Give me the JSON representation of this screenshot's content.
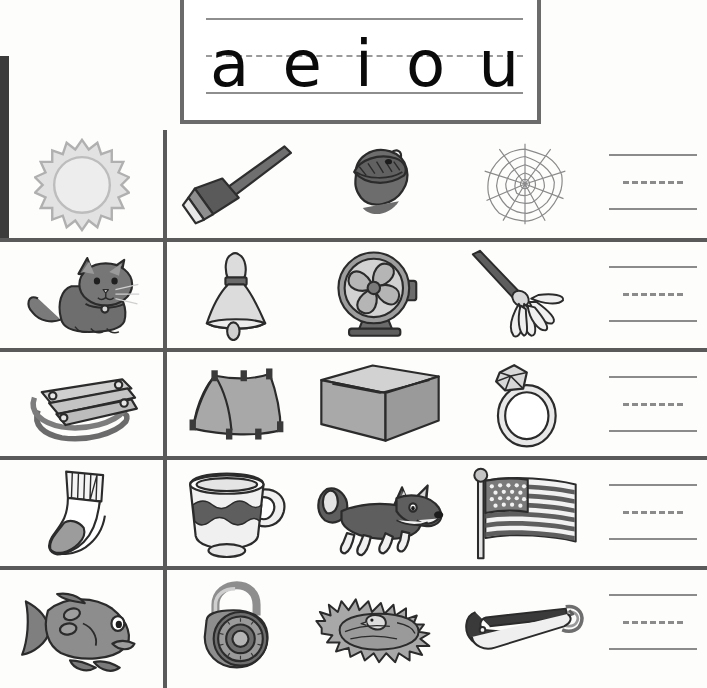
{
  "worksheet": {
    "title": "Short Vowel Beginning Sounds Worksheet",
    "header": {
      "name": "vowel-guide-box",
      "vowels": [
        "a",
        "e",
        "i",
        "o",
        "u"
      ],
      "guide_lines": {
        "top": "solid",
        "middle": "dashed",
        "baseline": "solid"
      }
    },
    "colors": {
      "page_background": "#fdfdfc",
      "grid_line": "#5a5a5a",
      "header_border": "#6b6b6b",
      "writing_line": "#8b8b8b",
      "letter_ink": "#0a0a0a",
      "art_dark": "#4a4a4a",
      "art_mid": "#8e8e8e",
      "art_light": "#d6d6d6",
      "scan_artifact": "#3b3b3b"
    },
    "columns": [
      "key-picture",
      "picture-1",
      "picture-2",
      "picture-3",
      "writing-lines"
    ],
    "rows": [
      {
        "vowel": "a",
        "key_picture": {
          "name": "sun",
          "label": "sun"
        },
        "pictures": [
          {
            "name": "rake",
            "label": "rake"
          },
          {
            "name": "acorn",
            "label": "acorn"
          },
          {
            "name": "web",
            "label": "web"
          }
        ],
        "writing_lines": "blank"
      },
      {
        "vowel": "a",
        "key_picture": {
          "name": "cat",
          "label": "cat"
        },
        "pictures": [
          {
            "name": "bell",
            "label": "bell"
          },
          {
            "name": "fan",
            "label": "fan"
          },
          {
            "name": "mop",
            "label": "mop"
          }
        ],
        "writing_lines": "blank"
      },
      {
        "vowel": "e",
        "key_picture": {
          "name": "sled",
          "label": "sled"
        },
        "pictures": [
          {
            "name": "tent",
            "label": "tent"
          },
          {
            "name": "box",
            "label": "box"
          },
          {
            "name": "ring",
            "label": "ring"
          }
        ],
        "writing_lines": "blank"
      },
      {
        "vowel": "o",
        "key_picture": {
          "name": "sock",
          "label": "sock"
        },
        "pictures": [
          {
            "name": "cup",
            "label": "cup"
          },
          {
            "name": "fox",
            "label": "fox"
          },
          {
            "name": "flag",
            "label": "flag"
          }
        ],
        "writing_lines": "blank"
      },
      {
        "vowel": "i",
        "key_picture": {
          "name": "fish",
          "label": "fish"
        },
        "pictures": [
          {
            "name": "lock",
            "label": "lock"
          },
          {
            "name": "nest",
            "label": "nest"
          },
          {
            "name": "safety-pin",
            "label": "pin"
          }
        ],
        "writing_lines": "blank"
      }
    ]
  }
}
